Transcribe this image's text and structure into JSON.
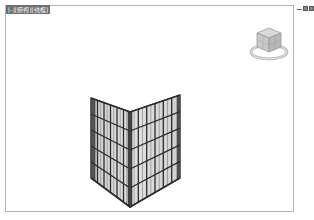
{
  "viewport": {
    "label": "[-][俯视][线框]",
    "controls": {
      "minimize": "minimize",
      "restore": "restore",
      "close": "close"
    }
  },
  "viewcube": {
    "icon": "viewcube-icon",
    "ring_icon": "compass-ring-icon"
  },
  "model": {
    "name": "curtain-wall-corner",
    "walls": [
      {
        "name": "left-wall",
        "rows": 5,
        "cols": 6
      },
      {
        "name": "right-wall",
        "rows": 5,
        "cols": 6
      }
    ]
  },
  "colors": {
    "frame": "#2b2b2b",
    "glass": "#d4d4d4",
    "glass_light": "#e6e6e6",
    "border": "#b4b4b4",
    "label_bg": "#6e6e6e"
  }
}
